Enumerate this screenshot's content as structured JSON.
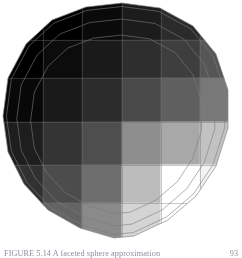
{
  "figure": {
    "background_color": "#ffffff",
    "width": 242,
    "height": 258
  },
  "caption": {
    "text": "FIGURE 5.14 A faceted sphere approximation",
    "page_number": "93",
    "visible": "clipped"
  },
  "render": {
    "object_name": "polyhedral-sphere",
    "facet_count": 18,
    "center_x": 118,
    "center_y": 120,
    "radius_x": 116,
    "radius_y": 117,
    "outline_color": "#8a8a8a",
    "outline_width": 0.7,
    "wireframe_visible_on_light_tiles": "true",
    "silhouette_vertices": [
      [
        122,
        3
      ],
      [
        160,
        8
      ],
      [
        193,
        26
      ],
      [
        216,
        54
      ],
      [
        228,
        90
      ],
      [
        228,
        128
      ],
      [
        216,
        166
      ],
      [
        196,
        196
      ],
      [
        168,
        220
      ],
      [
        134,
        236
      ],
      [
        114,
        238
      ],
      [
        80,
        228
      ],
      [
        48,
        210
      ],
      [
        24,
        184
      ],
      [
        8,
        152
      ],
      [
        3,
        116
      ],
      [
        8,
        78
      ],
      [
        26,
        44
      ],
      [
        52,
        20
      ],
      [
        86,
        7
      ]
    ]
  },
  "checkerboard": {
    "type": "grid-texture",
    "column_edges": [
      3,
      43,
      82,
      122,
      161,
      200,
      232
    ],
    "row_edges": [
      3,
      40,
      78,
      122,
      165,
      203,
      240
    ],
    "columns": 6,
    "rows": 6,
    "description": "gray ramp from black at upper-left to white at lower-right",
    "tiles": [
      [
        "#000000",
        "#000000",
        "#0a0a0a",
        "#1c1c1c",
        "#2b2b2b",
        "#3a3a3a"
      ],
      [
        "#000000",
        "#0c0c0c",
        "#1a1a1a",
        "#2e2e2e",
        "#3e3e3e",
        "#565656"
      ],
      [
        "#080808",
        "#1a1a1a",
        "#2c2c2c",
        "#4a4a4a",
        "#5f5f5f",
        "#787878"
      ],
      [
        "#1e1e1e",
        "#343434",
        "#4e4e4e",
        "#8e8e8e",
        "#a8a8a8",
        "#c2c2c2"
      ],
      [
        "#313131",
        "#4c4c4c",
        "#6e6e6e",
        "#bcbcbc",
        "#ffffff",
        "#f2f2f2"
      ],
      [
        "#444444",
        "#636363",
        "#8a8a8a",
        "#d4d4d4",
        "#ffffff",
        "#ffffff"
      ]
    ]
  }
}
